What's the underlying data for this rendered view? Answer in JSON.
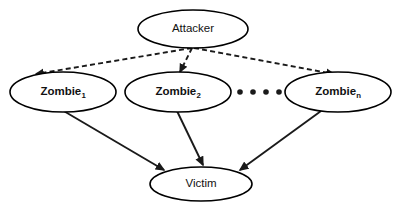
{
  "diagram": {
    "background_color": "#ffffff",
    "stroke_color": "#1a1a1a",
    "node_fill": "#ffffff",
    "nodes": [
      {
        "id": "attacker",
        "label": "Attacker",
        "label_sub": "",
        "bold": false,
        "cx": 193,
        "cy": 29,
        "rx": 55,
        "ry": 19
      },
      {
        "id": "zombie-1",
        "label": "Zombie",
        "label_sub": "1",
        "bold": true,
        "cx": 63,
        "cy": 92,
        "rx": 53,
        "ry": 20
      },
      {
        "id": "zombie-2",
        "label": "Zombie",
        "label_sub": "2",
        "bold": true,
        "cx": 178,
        "cy": 92,
        "rx": 53,
        "ry": 20
      },
      {
        "id": "zombie-n",
        "label": "Zombie",
        "label_sub": "n",
        "bold": true,
        "cx": 338,
        "cy": 92,
        "rx": 53,
        "ry": 20
      },
      {
        "id": "victim",
        "label": "Victim",
        "label_sub": "",
        "bold": false,
        "cx": 201,
        "cy": 184,
        "rx": 51,
        "ry": 17
      }
    ],
    "ellipsis": {
      "name": "horizontal-ellipsis",
      "dot_count": 4,
      "dot_radius": 2.8,
      "cy": 92,
      "x_positions": [
        240,
        253,
        266,
        279
      ]
    },
    "edges": [
      {
        "id": "attacker-to-zombie-1",
        "from": "attacker",
        "to": "zombie-1",
        "style": "dashed",
        "x1": 192,
        "y1": 48,
        "x2": 36,
        "y2": 74
      },
      {
        "id": "attacker-to-zombie-2",
        "from": "attacker",
        "to": "zombie-2",
        "style": "dashed",
        "x1": 192,
        "y1": 48,
        "x2": 180,
        "y2": 72
      },
      {
        "id": "attacker-to-zombie-n",
        "from": "attacker",
        "to": "zombie-n",
        "style": "dashed",
        "x1": 194,
        "y1": 48,
        "x2": 334,
        "y2": 74
      },
      {
        "id": "zombie-1-to-victim",
        "from": "zombie-1",
        "to": "victim",
        "style": "solid",
        "x1": 62,
        "y1": 110,
        "x2": 164,
        "y2": 170
      },
      {
        "id": "zombie-2-to-victim",
        "from": "zombie-2",
        "to": "victim",
        "style": "solid",
        "x1": 177,
        "y1": 111,
        "x2": 203,
        "y2": 165
      },
      {
        "id": "zombie-n-to-victim",
        "from": "zombie-n",
        "to": "victim",
        "style": "solid",
        "x1": 321,
        "y1": 111,
        "x2": 240,
        "y2": 170
      }
    ]
  }
}
